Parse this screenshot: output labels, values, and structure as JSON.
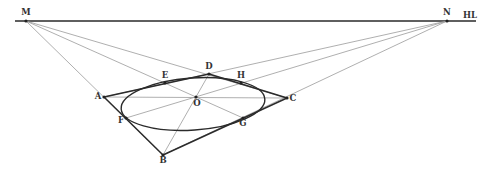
{
  "diagram": {
    "type": "perspective-construction",
    "horizon_label": "HL",
    "vanishing_points": [
      "M",
      "N"
    ],
    "points": [
      "M",
      "N",
      "A",
      "B",
      "C",
      "D",
      "E",
      "F",
      "G",
      "H",
      "O"
    ],
    "square_edges": [
      [
        "A",
        "D"
      ],
      [
        "D",
        "C"
      ],
      [
        "C",
        "B"
      ],
      [
        "B",
        "A"
      ]
    ],
    "construction_lines": [
      [
        "M",
        "B"
      ],
      [
        "M",
        "G"
      ],
      [
        "M",
        "C"
      ],
      [
        "N",
        "A"
      ],
      [
        "N",
        "F"
      ],
      [
        "N",
        "B"
      ],
      [
        "A",
        "C"
      ],
      [
        "D",
        "B"
      ]
    ],
    "inscribed_ellipse_tangent_points": [
      "E",
      "H",
      "G",
      "F"
    ],
    "center": "O"
  },
  "colors": {
    "ink": "#2b2b2b",
    "construction": "#9a9a9a",
    "background": "#ffffff"
  }
}
